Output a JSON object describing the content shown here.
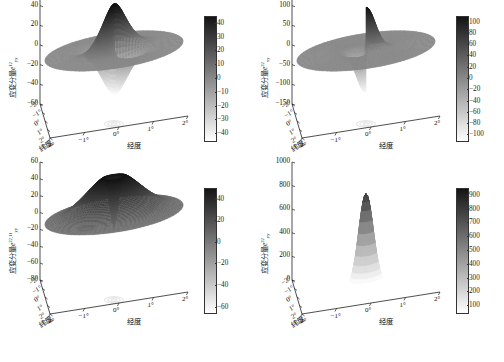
{
  "figure": {
    "panel_count": 4,
    "colormap": "grayscale-inverted",
    "caption": ""
  },
  "axis_titles": {
    "latitude": "纬度",
    "longitude": "经度",
    "strain_prefix": "应变分量"
  },
  "degree_ticks": [
    "−2°",
    "−1°",
    "0°",
    "1°",
    "2°"
  ],
  "chart_data": [
    {
      "id": "panel-1",
      "type": "surface",
      "title": "",
      "zlabel_text": "应变分量",
      "zlabel_symbol": "e",
      "zlabel_sub": "yy",
      "zlabel_sup": "12",
      "xlabel": "经度",
      "ylabel": "纬度",
      "xticks": [
        "−2°",
        "−1°",
        "0°",
        "1°",
        "2°"
      ],
      "yticks": [
        "−2°",
        "−1°",
        "0°",
        "1°",
        "2°"
      ],
      "zticks": [
        "60",
        "40",
        "20",
        "0",
        "−20",
        "−40",
        "−60"
      ],
      "zlim": [
        -60,
        60
      ],
      "xlim": [
        -2,
        2
      ],
      "ylim": [
        -2,
        2
      ],
      "colorbar": {
        "ticks": [
          "40",
          "30",
          "20",
          "10",
          "0",
          "−10",
          "−20",
          "−30",
          "−40"
        ],
        "min": -45,
        "max": 45
      },
      "shape": "quadrupole",
      "description": "Flat disc with two tall positive lobes and two deep negative lobes near center"
    },
    {
      "id": "panel-2",
      "type": "surface",
      "title": "",
      "zlabel_text": "应变分量",
      "zlabel_symbol": "e",
      "zlabel_sub": "xy",
      "zlabel_sup": "22",
      "xlabel": "经度",
      "ylabel": "纬度",
      "xticks": [
        "−2°",
        "−1°",
        "0°",
        "1°",
        "2°"
      ],
      "yticks": [
        "−2°",
        "−1°",
        "0°",
        "1°",
        "2°"
      ],
      "zticks": [
        "150",
        "100",
        "50",
        "0",
        "−50",
        "−100",
        "−150"
      ],
      "zlim": [
        -150,
        150
      ],
      "xlim": [
        -2,
        2
      ],
      "ylim": [
        -2,
        2
      ],
      "colorbar": {
        "ticks": [
          "100",
          "80",
          "60",
          "40",
          "20",
          "0",
          "−20",
          "−40",
          "−60",
          "−80",
          "−100"
        ],
        "min": -110,
        "max": 110
      },
      "shape": "dipole-spike",
      "description": "Flat disc with one narrow positive spike and one narrow negative spike at center"
    },
    {
      "id": "panel-3",
      "type": "surface",
      "title": "",
      "zlabel_text": "应变分量",
      "zlabel_symbol": "e",
      "zlabel_sub": "yy",
      "zlabel_sup": "22,11",
      "xlabel": "经度",
      "ylabel": "纬度",
      "xticks": [
        "−2°",
        "−1°",
        "0°",
        "1°",
        "2°"
      ],
      "yticks": [
        "−2°",
        "−1°",
        "0°",
        "1°",
        "2°"
      ],
      "zticks": [
        "60",
        "40",
        "20",
        "0",
        "−20",
        "−40",
        "−60",
        "−80"
      ],
      "zlim": [
        -80,
        60
      ],
      "xlim": [
        -2,
        2
      ],
      "ylim": [
        -2,
        2
      ],
      "colorbar": {
        "ticks": [
          "40",
          "20",
          "0",
          "−20",
          "−40",
          "−60"
        ],
        "min": -65,
        "max": 50
      },
      "shape": "dome",
      "description": "Broad flat disc with wide central dome and thin negative spike below"
    },
    {
      "id": "panel-4",
      "type": "surface",
      "title": "",
      "zlabel_text": "应变分量",
      "zlabel_symbol": "e",
      "zlabel_sub": "yy",
      "zlabel_sup": "22",
      "xlabel": "经度",
      "ylabel": "纬度",
      "xticks": [
        "−2°",
        "−1°",
        "0°",
        "1°",
        "2°"
      ],
      "yticks": [
        "−2°",
        "−1°",
        "0°",
        "1°",
        "2°"
      ],
      "zticks": [
        "1000",
        "800",
        "600",
        "400",
        "200",
        "0"
      ],
      "zlim": [
        0,
        1000
      ],
      "xlim": [
        -2,
        2
      ],
      "ylim": [
        -2,
        2
      ],
      "colorbar": {
        "ticks": [
          "900",
          "800",
          "700",
          "600",
          "500",
          "400",
          "300",
          "200",
          "100"
        ],
        "min": 50,
        "max": 950
      },
      "shape": "peak",
      "description": "Dark flat disc at zero with one tall bright narrow peak reaching about 780"
    }
  ]
}
